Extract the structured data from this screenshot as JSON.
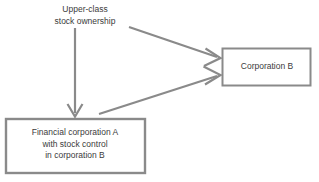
{
  "diagram": {
    "type": "flow-diagram",
    "background_color": "#ffffff",
    "stroke_color": "#8a8a8a",
    "text_color": "#3b3b3b",
    "nodes": [
      {
        "id": "upper-class-stock-ownership",
        "shape": "text-only",
        "lines": [
          "Upper-class",
          "stock ownership"
        ]
      },
      {
        "id": "corporation-b",
        "shape": "rectangle",
        "lines": [
          "Corporation B"
        ]
      },
      {
        "id": "financial-corporation-a",
        "shape": "rectangle",
        "lines": [
          "Financial corporation A",
          "with stock control",
          "in corporation B"
        ]
      }
    ],
    "edges": [
      {
        "id": "edge-upper-class-to-financial-corporation-a",
        "from": "upper-class-stock-ownership",
        "to": "financial-corporation-a",
        "direction": "down",
        "arrowhead": "open-v"
      },
      {
        "id": "edge-upper-class-to-corporation-b",
        "from": "upper-class-stock-ownership",
        "to": "corporation-b",
        "direction": "down-right",
        "arrowhead": "open-v"
      },
      {
        "id": "edge-financial-corporation-a-to-corporation-b",
        "from": "financial-corporation-a",
        "to": "corporation-b",
        "direction": "up-right",
        "arrowhead": "open-v"
      }
    ]
  }
}
